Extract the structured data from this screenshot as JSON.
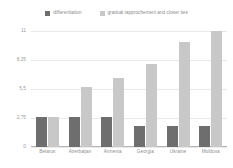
{
  "chart_data": {
    "type": "bar",
    "title": "",
    "subtitle": "",
    "xlabel": "",
    "ylabel": "",
    "ylim": [
      0,
      11
    ],
    "yticks": [
      "0",
      "2,75",
      "5,5",
      "8,25",
      "11"
    ],
    "ytick_values": [
      0,
      2.75,
      5.5,
      8.25,
      11
    ],
    "grid": true,
    "legend_position": "top",
    "categories": [
      "Belarus",
      "Azerbaijan",
      "Armenia",
      "Georgia",
      "Ukraine",
      "Moldova"
    ],
    "series": [
      {
        "name": "differentiation",
        "color": "#6e6e6e",
        "values": [
          2.8,
          2.8,
          2.8,
          2.0,
          2.0,
          2.0
        ]
      },
      {
        "name": "gradual rapprochement and closer ties",
        "color": "#c8c8c8",
        "values": [
          2.8,
          5.7,
          6.5,
          7.9,
          10.0,
          11.0
        ]
      }
    ]
  },
  "legend": {
    "entries": [
      {
        "label": "differentiation",
        "color": "#6e6e6e"
      },
      {
        "label": "gradual rapprochement and closer ties",
        "color": "#c8c8c8"
      }
    ]
  },
  "axes": {
    "y": {
      "ticks": [
        {
          "label": "11",
          "value": 11
        },
        {
          "label": "8,25",
          "value": 8.25
        },
        {
          "label": "5,5",
          "value": 5.5
        },
        {
          "label": "2,75",
          "value": 2.75
        },
        {
          "label": "0",
          "value": 0
        }
      ]
    },
    "x": {
      "labels": [
        "Belarus",
        "Azerbaijan",
        "Armenia",
        "Georgia",
        "Ukraine",
        "Moldova"
      ]
    }
  },
  "colors": {
    "series_dark": "#6e6e6e",
    "series_light": "#c8c8c8",
    "gridline": "#e9e9e9",
    "axis": "#b4b4b4",
    "text": "#909090",
    "background": "#ffffff"
  }
}
